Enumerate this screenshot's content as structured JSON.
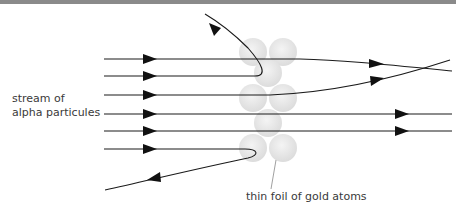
{
  "diagram": {
    "labels": {
      "stream_line1": "stream of",
      "stream_line2": "alpha particules",
      "foil": "thin foil of gold atoms"
    },
    "colors": {
      "line": "#1a1a1a",
      "atom_fill": "#e4e4e4",
      "atom_edge": "#d4d4d4",
      "text": "#3a3a3a",
      "top_border": "#8a8a8a"
    },
    "atoms": [
      {
        "cx": 253,
        "cy": 52,
        "r": 13
      },
      {
        "cx": 283,
        "cy": 52,
        "r": 13
      },
      {
        "cx": 268,
        "cy": 73,
        "r": 13
      },
      {
        "cx": 253,
        "cy": 97,
        "r": 13
      },
      {
        "cx": 283,
        "cy": 97,
        "r": 13
      },
      {
        "cx": 268,
        "cy": 122,
        "r": 13
      },
      {
        "cx": 253,
        "cy": 147,
        "r": 13
      },
      {
        "cx": 283,
        "cy": 147,
        "r": 13
      }
    ],
    "paths": [
      {
        "name": "deflected-back-top",
        "d": "M104 59 L260 59 C275 59 275 48 258 30 L205 14",
        "arrows": [
          {
            "x": 150,
            "y": 59,
            "angle": 0
          },
          {
            "x": 217,
            "y": 30,
            "angle": 213
          }
        ]
      },
      {
        "name": "slight-deflection-down",
        "d": "M104 76 L245 76 C270 76 265 56 240 55 L240 55",
        "arrows": [
          {
            "x": 150,
            "y": 76,
            "angle": 0
          }
        ]
      },
      {
        "name": "through-deflected-down",
        "d": "M104 59 L290 59 C330 60 370 63 452 71",
        "arrows": [
          {
            "x": 375,
            "y": 64,
            "angle": 4
          }
        ]
      },
      {
        "name": "through-deflected-up",
        "d": "M104 95 L270 95 C320 92 370 85 450 60",
        "arrows": [
          {
            "x": 375,
            "y": 80,
            "angle": -10
          }
        ]
      },
      {
        "name": "straight-1",
        "d": "M104 114 L452 114",
        "arrows": [
          {
            "x": 150,
            "y": 114,
            "angle": 0
          },
          {
            "x": 400,
            "y": 114,
            "angle": 0
          }
        ]
      },
      {
        "name": "straight-2",
        "d": "M104 131 L452 131",
        "arrows": [
          {
            "x": 150,
            "y": 131,
            "angle": 0
          },
          {
            "x": 400,
            "y": 131,
            "angle": 0
          }
        ]
      },
      {
        "name": "reflected-bottom",
        "d": "M104 150 L245 150 C262 150 260 158 245 158 C200 166 150 178 105 190",
        "arrows": [
          {
            "x": 150,
            "y": 150,
            "angle": 0
          },
          {
            "x": 155,
            "y": 179,
            "angle": 165
          }
        ]
      }
    ],
    "leader_line": {
      "x1": 276,
      "y1": 158,
      "x2": 271,
      "y2": 190
    }
  }
}
